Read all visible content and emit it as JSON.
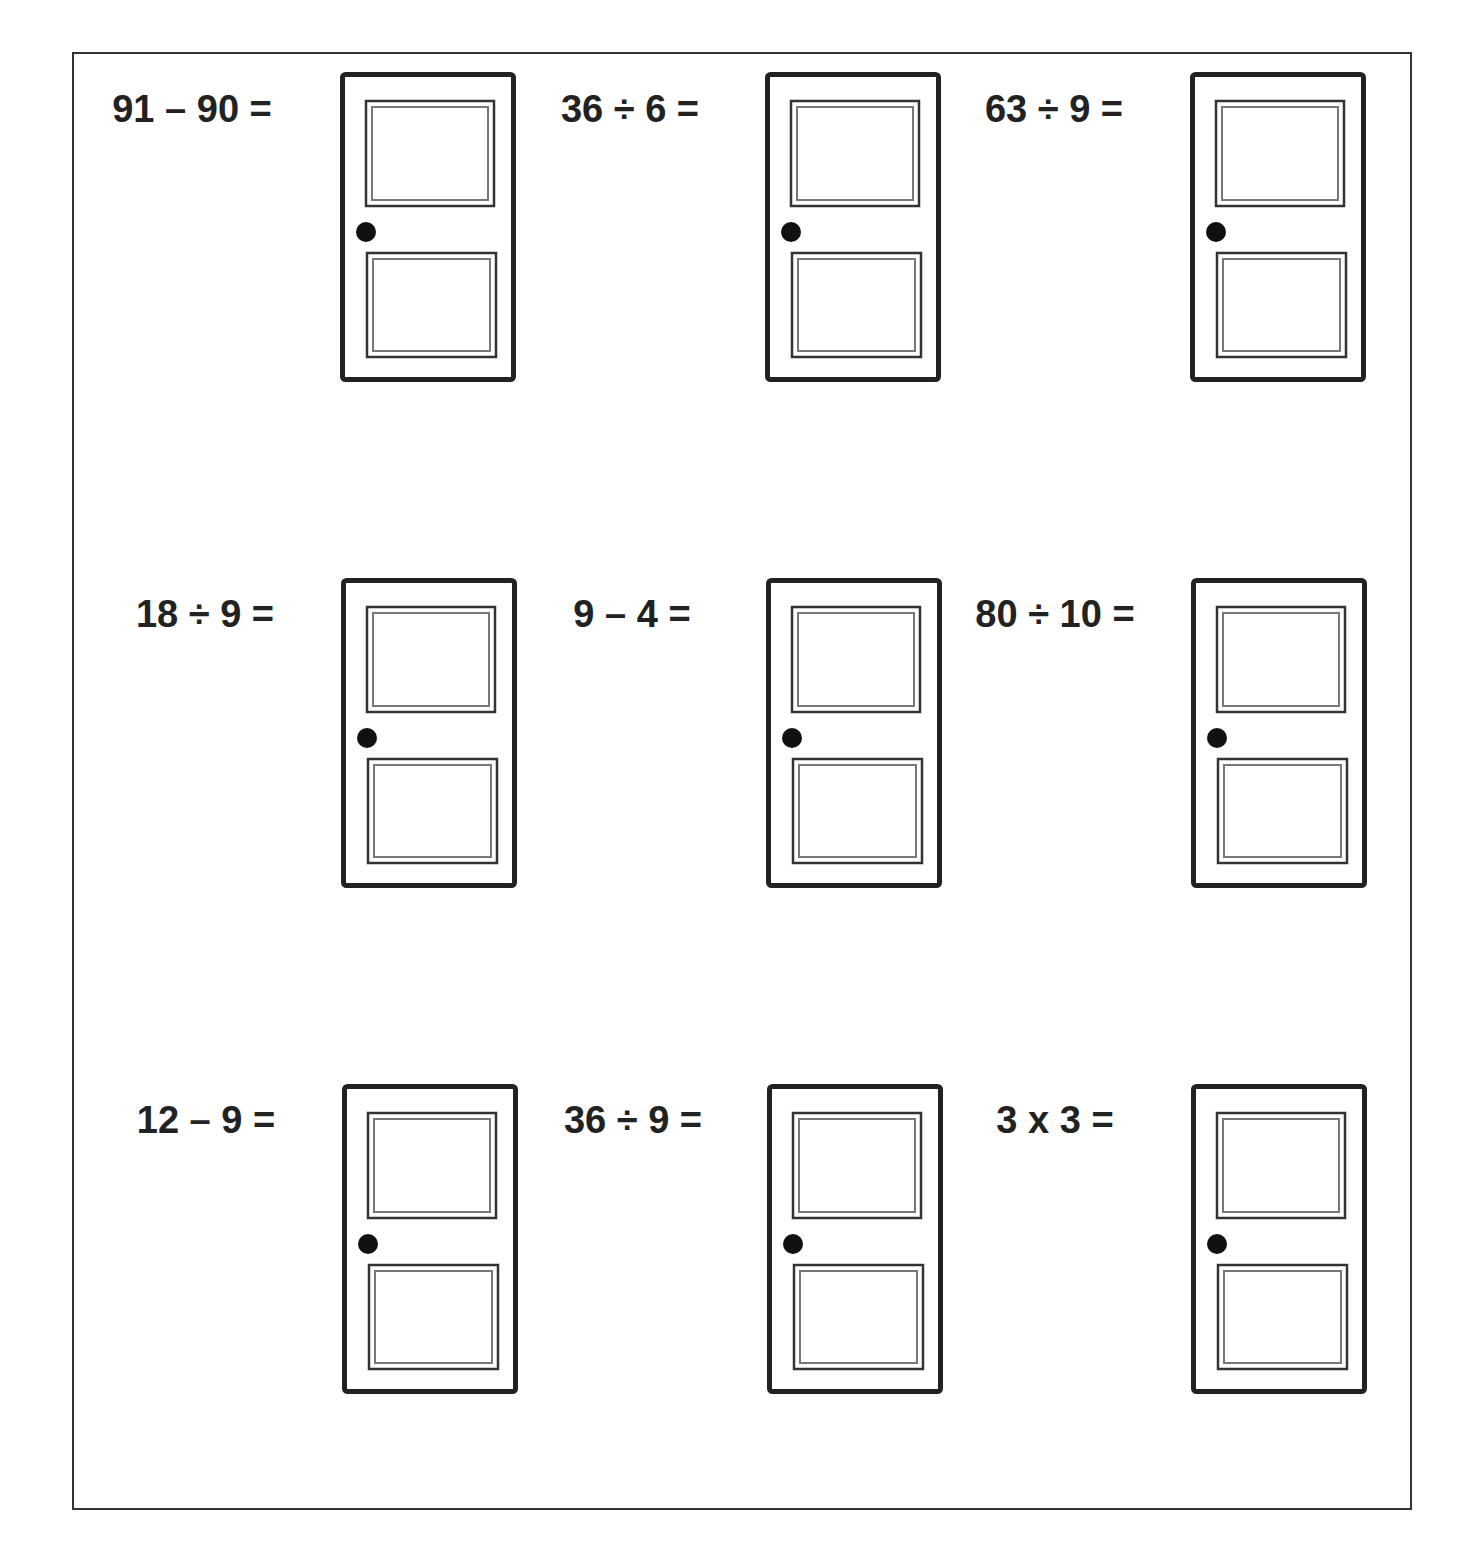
{
  "worksheet": {
    "problems": [
      {
        "expression": "91 – 90 =",
        "row": 0,
        "col": 0
      },
      {
        "expression": "36 ÷ 6 =",
        "row": 0,
        "col": 1
      },
      {
        "expression": "63 ÷ 9 =",
        "row": 0,
        "col": 2
      },
      {
        "expression": "18 ÷ 9 =",
        "row": 1,
        "col": 0
      },
      {
        "expression": "9 – 4 =",
        "row": 1,
        "col": 1
      },
      {
        "expression": "80 ÷ 10 =",
        "row": 1,
        "col": 2
      },
      {
        "expression": "12 – 9 =",
        "row": 2,
        "col": 0
      },
      {
        "expression": "36 ÷ 9 =",
        "row": 2,
        "col": 1
      },
      {
        "expression": "3 x 3 =",
        "row": 2,
        "col": 2
      }
    ],
    "door_icon": "door-icon"
  }
}
